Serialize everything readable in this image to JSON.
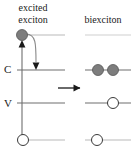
{
  "figure": {
    "background": "#ffffff",
    "width": 138,
    "height": 154
  },
  "captions": {
    "left": "excited exciton",
    "left_line1": "excited",
    "left_line2": "exciton",
    "right": "biexciton"
  },
  "axis_labels": {
    "conduction": "C",
    "valence": "V"
  },
  "colors": {
    "electron_fill": "#7d7d7d",
    "electron_stroke": "#555555",
    "hole_fill": "#ffffff",
    "hole_stroke": "#3a3a3a",
    "level_line": "#6e6e6e",
    "level_line_faint": "#b9b9b9",
    "arrow": "#1a1a1a",
    "text": "#1a1a1a"
  },
  "left_panel": {
    "name": "excited-exciton-panel",
    "levels": [
      {
        "id": "excited",
        "label": "",
        "y": 35,
        "x1": 17,
        "x2": 65,
        "style": "faint"
      },
      {
        "id": "conduction",
        "label": "C",
        "y": 70,
        "x1": 17,
        "x2": 65,
        "style": "solid"
      },
      {
        "id": "valence",
        "label": "V",
        "y": 103,
        "x1": 17,
        "x2": 65,
        "style": "solid"
      },
      {
        "id": "ground",
        "label": "",
        "y": 140,
        "x1": 17,
        "x2": 65,
        "style": "faint"
      }
    ],
    "particles": [
      {
        "type": "electron",
        "level": "excited",
        "x": 22,
        "y": 35,
        "r": 5.5
      },
      {
        "type": "hole",
        "level": "ground",
        "x": 23,
        "y": 140,
        "r": 5.5
      }
    ],
    "arrows": [
      {
        "id": "excitation-up-arrow",
        "kind": "straight",
        "x": 22,
        "y_from": 140,
        "y_to": 42,
        "head": "up"
      },
      {
        "id": "relaxation-curved-arrow",
        "kind": "curved",
        "from_x": 26,
        "from_y": 35,
        "to_x": 35,
        "to_y": 68,
        "head": "down"
      }
    ]
  },
  "transition": {
    "name": "transition-arrow",
    "kind": "straight-right",
    "x_from": 58,
    "x_to": 85,
    "y": 88
  },
  "right_panel": {
    "name": "biexciton-panel",
    "levels": [
      {
        "id": "excited",
        "label": "",
        "y": 35,
        "x1": 85,
        "x2": 131,
        "style": "faint"
      },
      {
        "id": "conduction",
        "label": "",
        "y": 70,
        "x1": 85,
        "x2": 131,
        "style": "solid"
      },
      {
        "id": "valence",
        "label": "",
        "y": 103,
        "x1": 85,
        "x2": 131,
        "style": "solid"
      },
      {
        "id": "ground",
        "label": "",
        "y": 140,
        "x1": 85,
        "x2": 131,
        "style": "faint"
      }
    ],
    "particles": [
      {
        "type": "electron",
        "level": "conduction",
        "x": 98,
        "y": 70,
        "r": 5.5
      },
      {
        "type": "electron",
        "level": "conduction",
        "x": 113,
        "y": 70,
        "r": 5.5
      },
      {
        "type": "hole",
        "level": "valence",
        "x": 113,
        "y": 103,
        "r": 5.5
      },
      {
        "type": "hole",
        "level": "ground",
        "x": 97,
        "y": 140,
        "r": 5.5
      }
    ],
    "arrows": []
  }
}
